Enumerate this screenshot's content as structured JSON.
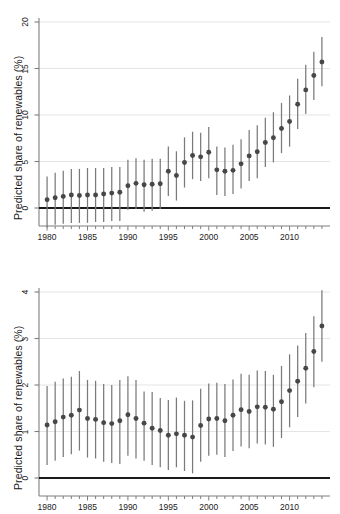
{
  "chart_data": [
    {
      "panel": "top",
      "type": "scatter",
      "title": "",
      "xlabel": "",
      "ylabel": "Predicted share of renewables (%)",
      "grid": true,
      "legend": null,
      "xlim": [
        1979.0,
        2015.0
      ],
      "ylim": [
        -2.6,
        20.6
      ],
      "yticks": [
        0,
        5,
        10,
        15,
        20
      ],
      "ytick_labels": [
        "0",
        "5",
        "10",
        "15",
        "20"
      ],
      "xticks": [
        1980,
        1985,
        1990,
        1995,
        2000,
        2005,
        2010
      ],
      "xtick_labels": [
        "1980",
        "1985",
        "1990",
        "1995",
        "2000",
        "2005",
        "2010"
      ],
      "xminor_step": 1,
      "zero_line": 0,
      "marker": "filled-circle",
      "error_bar_style": "vertical-line-no-caps",
      "x": [
        1980,
        1981,
        1982,
        1983,
        1984,
        1985,
        1986,
        1987,
        1988,
        1989,
        1990,
        1991,
        1992,
        1993,
        1994,
        1995,
        1996,
        1997,
        1998,
        1999,
        2000,
        2001,
        2002,
        2003,
        2004,
        2005,
        2006,
        2007,
        2008,
        2009,
        2010,
        2011,
        2012,
        2013,
        2014
      ],
      "values": [
        0.9,
        1.1,
        1.25,
        1.4,
        1.35,
        1.4,
        1.4,
        1.5,
        1.6,
        1.7,
        2.4,
        2.65,
        2.5,
        2.55,
        2.6,
        3.95,
        3.5,
        4.9,
        5.65,
        5.5,
        6.0,
        4.1,
        3.95,
        4.05,
        4.75,
        5.6,
        6.05,
        7.05,
        7.55,
        8.55,
        9.3,
        11.15,
        12.7,
        14.25,
        15.7
      ],
      "ci_low": [
        -2.1,
        -1.8,
        -1.7,
        -1.6,
        -1.6,
        -1.6,
        -1.5,
        -1.5,
        -1.4,
        -1.4,
        -0.2,
        -0.1,
        -0.4,
        -0.3,
        -0.1,
        1.3,
        0.8,
        2.2,
        3.1,
        2.9,
        3.2,
        1.4,
        1.3,
        1.5,
        2.1,
        2.9,
        3.2,
        4.4,
        4.9,
        5.9,
        6.6,
        8.5,
        10.1,
        11.6,
        13.1
      ],
      "ci_high": [
        3.4,
        3.8,
        4.0,
        4.2,
        4.2,
        4.3,
        4.3,
        4.3,
        4.4,
        4.4,
        5.2,
        5.35,
        5.2,
        5.3,
        5.3,
        6.6,
        6.1,
        7.6,
        8.2,
        8.1,
        8.7,
        6.6,
        6.5,
        6.8,
        7.4,
        8.4,
        8.9,
        9.7,
        10.3,
        11.3,
        12.1,
        13.9,
        15.4,
        16.8,
        18.4
      ]
    },
    {
      "panel": "bottom",
      "type": "scatter",
      "title": "",
      "xlabel": "",
      "ylabel": "Predicted share of renewables (%)",
      "grid": true,
      "legend": null,
      "xlim": [
        1979.0,
        2015.0
      ],
      "ylim": [
        -0.07,
        4.2
      ],
      "yticks": [
        0,
        1,
        2,
        3,
        4
      ],
      "ytick_labels": [
        "0",
        "1",
        "2",
        "3",
        "4"
      ],
      "xticks": [
        1980,
        1985,
        1990,
        1995,
        2000,
        2005,
        2010
      ],
      "xtick_labels": [
        "1980",
        "1985",
        "1990",
        "1995",
        "2000",
        "2005",
        "2010"
      ],
      "xminor_step": 1,
      "zero_line": 0,
      "marker": "filled-circle",
      "error_bar_style": "vertical-line-no-caps",
      "x": [
        1980,
        1981,
        1982,
        1983,
        1984,
        1985,
        1986,
        1987,
        1988,
        1989,
        1990,
        1991,
        1992,
        1993,
        1994,
        1995,
        1996,
        1997,
        1998,
        1999,
        2000,
        2001,
        2002,
        2003,
        2004,
        2005,
        2006,
        2007,
        2008,
        2009,
        2010,
        2011,
        2012,
        2013,
        2014
      ],
      "values": [
        1.14,
        1.21,
        1.31,
        1.35,
        1.46,
        1.28,
        1.26,
        1.19,
        1.17,
        1.23,
        1.36,
        1.28,
        1.18,
        1.07,
        1.02,
        0.92,
        0.95,
        0.92,
        0.88,
        1.13,
        1.27,
        1.28,
        1.23,
        1.35,
        1.47,
        1.43,
        1.53,
        1.52,
        1.48,
        1.64,
        1.88,
        2.08,
        2.36,
        2.72,
        3.27
      ],
      "ci_low": [
        0.28,
        0.37,
        0.45,
        0.51,
        0.59,
        0.44,
        0.42,
        0.35,
        0.32,
        0.3,
        0.48,
        0.42,
        0.37,
        0.28,
        0.23,
        0.17,
        0.23,
        0.15,
        0.1,
        0.35,
        0.48,
        0.5,
        0.45,
        0.58,
        0.68,
        0.64,
        0.74,
        0.72,
        0.67,
        0.86,
        1.09,
        1.31,
        1.6,
        1.95,
        2.5
      ],
      "ci_high": [
        1.98,
        2.07,
        2.14,
        2.18,
        2.3,
        2.11,
        2.09,
        2.02,
        2.0,
        2.11,
        2.19,
        2.11,
        1.86,
        1.85,
        1.72,
        1.68,
        1.73,
        1.66,
        1.67,
        1.92,
        2.03,
        2.05,
        2.02,
        2.12,
        2.24,
        2.22,
        2.31,
        2.3,
        2.22,
        2.41,
        2.66,
        2.85,
        3.12,
        3.48,
        4.04
      ]
    }
  ],
  "style": {
    "marker_color": "#474747",
    "errorbar_color": "#7a7a7a",
    "axis_color": "#7f7f7f",
    "zero_line_color": "#1a1a1a",
    "grid_color": "#e2e2e2",
    "text_color": "#1a1a1a",
    "background": "#ffffff"
  }
}
